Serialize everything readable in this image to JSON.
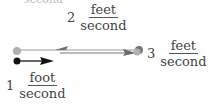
{
  "top_cutoff_text": "second",
  "velocities": [
    {
      "id": "v2",
      "coefficient": "2",
      "numerator": "feet",
      "denominator": "second",
      "direction": "left",
      "color": "#7a7a7a"
    },
    {
      "id": "v3",
      "coefficient": "3",
      "numerator": "feet",
      "denominator": "second",
      "direction": "right",
      "color": "#6e6e6e"
    },
    {
      "id": "v1",
      "coefficient": "1",
      "numerator": "foot",
      "denominator": "second",
      "direction": "right",
      "color": "#111111"
    }
  ],
  "colors": {
    "gray_dot": "#b0b0b0",
    "black_dot": "#111111",
    "line": "#888888"
  }
}
